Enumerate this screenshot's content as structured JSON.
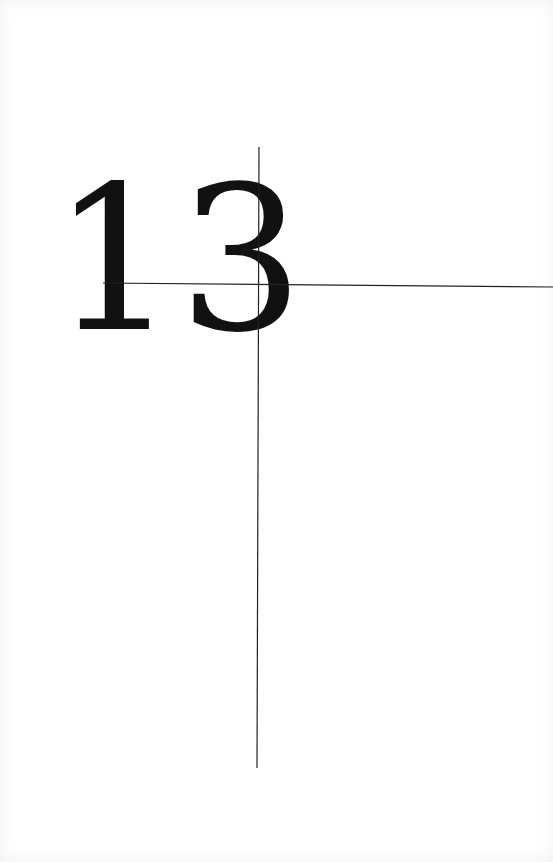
{
  "page": {
    "number": "13",
    "background": "#ffffff",
    "ink_color": "#111111",
    "rule_color": "#222222"
  },
  "rules": {
    "vertical": {
      "x1": 259,
      "y1": 147,
      "x2": 257,
      "y2": 768
    },
    "horizontal": {
      "x1": 103,
      "y1": 283,
      "x2": 553,
      "y2": 287
    }
  }
}
